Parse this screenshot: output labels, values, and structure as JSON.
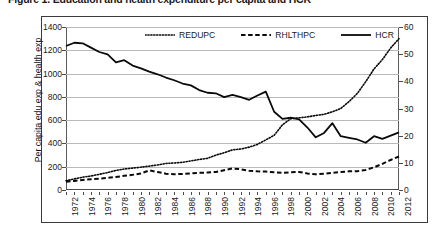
{
  "figure": {
    "caption": "Figure 1. Education and health expenditure per capita and HCR"
  },
  "chart_data": {
    "type": "line",
    "title": "",
    "xlabel": "",
    "ylabel": "Per capita edu exp & health exp",
    "y2label": "",
    "grid": true,
    "legend_position": "top-center",
    "xlim": [
      1972,
      2012
    ],
    "ylim": [
      0,
      1400
    ],
    "y2lim": [
      0,
      60
    ],
    "y_ticks": [
      0,
      200,
      400,
      600,
      800,
      1000,
      1200,
      1400
    ],
    "y2_ticks": [
      0,
      10,
      20,
      30,
      40,
      50,
      60
    ],
    "x": [
      1972,
      1973,
      1974,
      1975,
      1976,
      1977,
      1978,
      1979,
      1980,
      1981,
      1982,
      1983,
      1984,
      1985,
      1986,
      1987,
      1988,
      1989,
      1990,
      1991,
      1992,
      1993,
      1994,
      1995,
      1996,
      1997,
      1998,
      1999,
      2000,
      2001,
      2002,
      2003,
      2004,
      2005,
      2006,
      2007,
      2008,
      2009,
      2010,
      2011,
      2012
    ],
    "x_tick_labels": [
      "1972",
      "1974",
      "1976",
      "1978",
      "1980",
      "1982",
      "1984",
      "1986",
      "1988",
      "1990",
      "1992",
      "1994",
      "1996",
      "1998",
      "2000",
      "2002",
      "2004",
      "2006",
      "2008",
      "2010",
      "2012"
    ],
    "series": [
      {
        "name": "REDUPC",
        "axis": "left",
        "style": "dotted",
        "values": [
          80,
          95,
          110,
          120,
          135,
          150,
          168,
          180,
          188,
          196,
          205,
          215,
          228,
          232,
          238,
          250,
          262,
          272,
          300,
          320,
          345,
          352,
          368,
          392,
          430,
          470,
          560,
          612,
          620,
          628,
          640,
          650,
          672,
          700,
          760,
          830,
          930,
          1040,
          1120,
          1220,
          1300
        ]
      },
      {
        "name": "RHLTHPC",
        "axis": "left",
        "style": "dashed",
        "values": [
          70,
          78,
          86,
          92,
          98,
          104,
          112,
          122,
          130,
          142,
          168,
          155,
          140,
          135,
          138,
          142,
          148,
          150,
          155,
          170,
          185,
          178,
          165,
          160,
          158,
          152,
          148,
          152,
          155,
          142,
          135,
          140,
          148,
          155,
          160,
          162,
          172,
          195,
          225,
          258,
          288
        ]
      },
      {
        "name": "HCR",
        "axis": "right",
        "style": "solid",
        "values": [
          53.0,
          54.2,
          54.0,
          52.4,
          50.8,
          49.9,
          47.0,
          47.8,
          45.8,
          44.8,
          43.6,
          42.6,
          41.4,
          40.4,
          39.2,
          38.5,
          36.8,
          35.8,
          35.6,
          34.2,
          35.0,
          34.2,
          33.2,
          34.8,
          36.2,
          28.8,
          26.2,
          26.6,
          26.0,
          23.0,
          19.4,
          21.0,
          24.6,
          19.8,
          19.2,
          18.6,
          17.4,
          19.8,
          18.8,
          20.0,
          21.2
        ]
      }
    ]
  }
}
